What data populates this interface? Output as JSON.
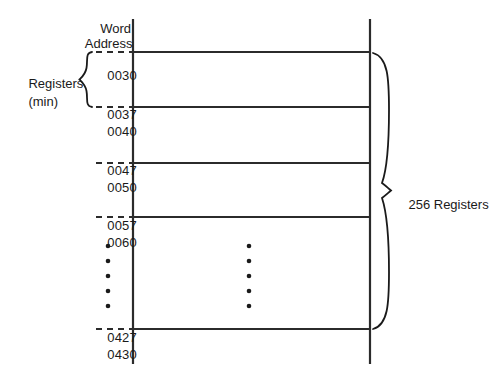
{
  "diagram": {
    "title_lines": [
      "Word",
      "Address"
    ],
    "header_line1": "Word",
    "header_line2": "Address",
    "left_brace_label_line1": "Registers",
    "left_brace_label_line2": "(min)",
    "right_brace_label": "256 Registers",
    "addresses": [
      {
        "id": "a0030",
        "text": "0030",
        "x": 92,
        "y": 54
      },
      {
        "id": "a0037",
        "text": "0037",
        "x": 92,
        "y": 93
      },
      {
        "id": "a0040",
        "text": "0040",
        "x": 92,
        "y": 110
      },
      {
        "id": "a0047",
        "text": "0047",
        "x": 92,
        "y": 149
      },
      {
        "id": "a0050",
        "text": "0050",
        "x": 92,
        "y": 166
      },
      {
        "id": "a0057",
        "text": "0057",
        "x": 92,
        "y": 204
      },
      {
        "id": "a0060",
        "text": "0060",
        "x": 92,
        "y": 221
      },
      {
        "id": "a0427",
        "text": "0427",
        "x": 92,
        "y": 316
      },
      {
        "id": "a0430",
        "text": "0430",
        "x": 92,
        "y": 333
      }
    ],
    "vertical_rules": [
      {
        "id": "left-rule",
        "x": 133,
        "y1": 19,
        "y2": 364
      },
      {
        "id": "right-rule",
        "x": 370,
        "y1": 19,
        "y2": 364
      }
    ],
    "row_lines": [
      {
        "id": "row-0030-top",
        "y": 52
      },
      {
        "id": "row-0037-bottom",
        "y": 107
      },
      {
        "id": "row-0047-bottom",
        "y": 163
      },
      {
        "id": "row-0057-bottom",
        "y": 217
      },
      {
        "id": "row-0427-bottom",
        "y": 329
      }
    ],
    "tick_dashes": [
      {
        "id": "dash-0030",
        "y": 52
      },
      {
        "id": "dash-0037",
        "y": 107
      },
      {
        "id": "dash-0047",
        "y": 163
      },
      {
        "id": "dash-0057",
        "y": 217
      },
      {
        "id": "dash-0427",
        "y": 329
      }
    ],
    "ellipsis_columns": [
      {
        "id": "ellipsis-left",
        "x": 108,
        "ys": [
          246,
          261,
          276,
          291,
          306
        ]
      },
      {
        "id": "ellipsis-right",
        "x": 249,
        "ys": [
          246,
          261,
          276,
          291,
          306
        ]
      }
    ],
    "left_brace": {
      "x": 84,
      "y_top": 52,
      "y_bottom": 107
    },
    "right_brace": {
      "x": 385,
      "y_top": 52,
      "y_bottom": 329
    },
    "colors": {
      "background": "#ffffff",
      "ink": "#1a1a1a",
      "rule": "#2b2b2b"
    }
  }
}
